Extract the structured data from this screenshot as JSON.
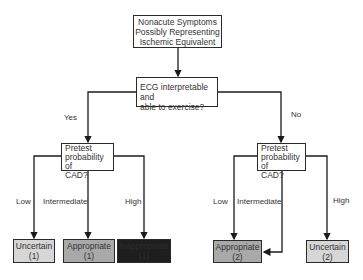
{
  "root": {
    "lines": [
      "Nonacute Symptoms",
      "Possibly Representing",
      "Ischemic Equivalent"
    ]
  },
  "decision_ecg": {
    "lines": [
      "ECG interpretable and",
      "able to exercise?"
    ]
  },
  "branches": {
    "yes": "Yes",
    "no": "No"
  },
  "left_pretest": {
    "lines": [
      "Pretest",
      "probability of",
      "CAD?"
    ]
  },
  "right_pretest": {
    "lines": [
      "Pretest",
      "probability of",
      "CAD?"
    ]
  },
  "probability_labels": {
    "low": "Low",
    "intermediate": "Intermediate",
    "high": "High"
  },
  "outcomes": {
    "left_low": {
      "label": "Uncertain",
      "score": "(1)",
      "color": "#d6d6d6"
    },
    "left_intermediate": {
      "label": "Appropriate",
      "score": "(1)",
      "color": "#a9a9a9"
    },
    "left_high": {
      "label": "Inappropriate",
      "score": "(1)",
      "color": "#1e1e1e"
    },
    "right_low_intermediate": {
      "label": "Appropriate",
      "score": "(2)",
      "color": "#a9a9a9"
    },
    "right_high": {
      "label": "Uncertain",
      "score": "(2)",
      "color": "#d6d6d6"
    }
  }
}
